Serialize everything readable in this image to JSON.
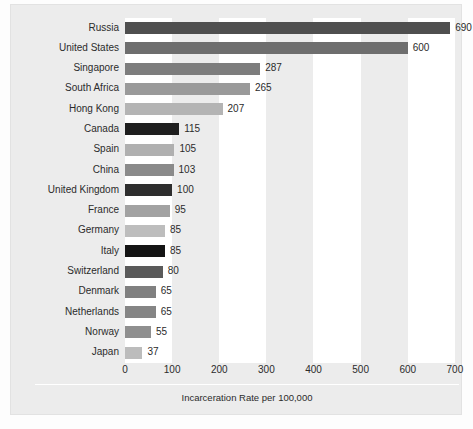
{
  "chart_data": {
    "type": "bar",
    "orientation": "horizontal",
    "title": "",
    "xlabel": "Incarceration Rate per 100,000",
    "ylabel": "",
    "xlim": [
      0,
      730
    ],
    "xticks": [
      0,
      100,
      200,
      300,
      400,
      500,
      600,
      700
    ],
    "grid": false,
    "banding": "alternating vertical white bands over 0-100, 200-300, 400-500, 600-700",
    "legend": null,
    "categories": [
      "Russia",
      "United States",
      "Singapore",
      "South Africa",
      "Hong Kong",
      "Canada",
      "Spain",
      "China",
      "United Kingdom",
      "France",
      "Germany",
      "Italy",
      "Switzerland",
      "Denmark",
      "Netherlands",
      "Norway",
      "Japan"
    ],
    "values": [
      690,
      600,
      287,
      265,
      207,
      115,
      105,
      103,
      100,
      95,
      85,
      85,
      80,
      65,
      65,
      55,
      37
    ],
    "value_labels": [
      "690",
      "600",
      "287",
      "265",
      "207",
      "115",
      "105",
      "103",
      "100",
      "95",
      "85",
      "85",
      "80",
      "65",
      "65",
      "55",
      "37"
    ],
    "bar_colors": [
      "#4f4f4f",
      "#6e6e6e",
      "#7d7d7d",
      "#9a9a9a",
      "#b4b4b4",
      "#1f1f1f",
      "#b0b0b0",
      "#8a8a8a",
      "#2e2e2e",
      "#a2a2a2",
      "#bdbdbd",
      "#141414",
      "#5a5a5a",
      "#808080",
      "#858585",
      "#8f8f8f",
      "#bcbcbc"
    ]
  },
  "colors": {
    "panel_background": "#ececec",
    "band_white": "#ffffff",
    "text": "#2b2b2b",
    "axis_line": "#ffffff"
  }
}
